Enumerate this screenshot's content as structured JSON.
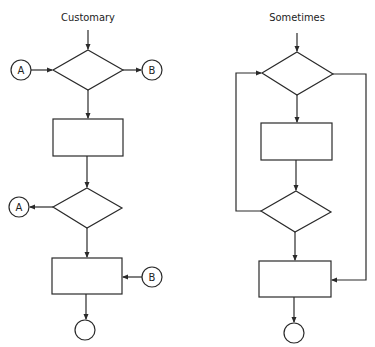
{
  "diagram": {
    "left": {
      "title": "Customary",
      "connectors": {
        "top_in": "A",
        "top_out": "B",
        "mid_out": "A",
        "bottom_in": "B"
      }
    },
    "right": {
      "title": "Sometimes"
    },
    "colors": {
      "stroke": "#2a2a2a",
      "background": "#ffffff"
    }
  }
}
